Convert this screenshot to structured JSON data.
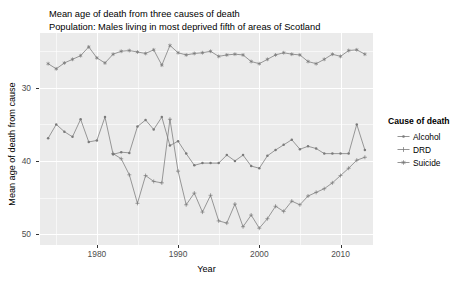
{
  "title": {
    "line1": "Mean age of death from three causes of death",
    "line2": "Population: Males living in most deprived fifth of areas of Scotland"
  },
  "axes": {
    "x_title": "Year",
    "y_title": "Mean age of death from cause",
    "x_ticks": [
      "1980",
      "1990",
      "2000",
      "2010"
    ],
    "y_ticks": [
      "50",
      "40",
      "30"
    ]
  },
  "legend": {
    "title": "Cause of death",
    "items": [
      {
        "label": "Alcohol",
        "color": "#7a7a7a",
        "shape": "dash"
      },
      {
        "label": "DRD",
        "color": "#7a7a7a",
        "shape": "plus"
      },
      {
        "label": "Suicide",
        "color": "#7a7a7a",
        "shape": "star"
      }
    ]
  },
  "chart_data": {
    "type": "line",
    "title": "Mean age of death from three causes of death",
    "subtitle": "Population: Males living in most deprived fifth of areas of Scotland",
    "xlabel": "Year",
    "ylabel": "Mean age of death from cause",
    "xlim": [
      1973,
      2014
    ],
    "ylim": [
      28.5,
      57.5
    ],
    "xticks": [
      1980,
      1990,
      2000,
      2010
    ],
    "yticks": [
      30,
      40,
      50
    ],
    "grid": true,
    "legend_position": "right",
    "legend_title": "Cause of death",
    "x": [
      1974,
      1975,
      1976,
      1977,
      1978,
      1979,
      1980,
      1981,
      1982,
      1983,
      1984,
      1985,
      1986,
      1987,
      1988,
      1989,
      1990,
      1991,
      1992,
      1993,
      1994,
      1995,
      1996,
      1997,
      1998,
      1999,
      2000,
      2001,
      2002,
      2003,
      2004,
      2005,
      2006,
      2007,
      2008,
      2009,
      2010,
      2011,
      2012,
      2013
    ],
    "series": [
      {
        "name": "Suicide",
        "color": "#7a7a7a",
        "values": [
          53.3,
          52.6,
          53.4,
          53.9,
          54.4,
          55.6,
          54.1,
          53.4,
          54.6,
          55.0,
          55.1,
          54.9,
          54.7,
          55.2,
          53.1,
          55.8,
          54.8,
          54.5,
          54.7,
          54.8,
          55.0,
          54.3,
          54.5,
          54.6,
          54.5,
          53.6,
          53.3,
          53.9,
          54.5,
          54.8,
          54.6,
          54.5,
          53.6,
          53.3,
          53.9,
          54.6,
          54.3,
          55.1,
          55.2,
          54.6
        ]
      },
      {
        "name": "Alcohol",
        "color": "#7a7a7a",
        "values": [
          43.1,
          45.0,
          44.0,
          43.3,
          45.7,
          42.6,
          42.8,
          46.0,
          40.9,
          41.2,
          41.1,
          44.7,
          45.6,
          44.3,
          46.0,
          42.1,
          42.7,
          41.0,
          39.4,
          39.7,
          39.7,
          39.7,
          40.8,
          40.0,
          40.8,
          39.3,
          39.0,
          40.7,
          41.5,
          42.2,
          42.9,
          41.6,
          42.0,
          41.7,
          41.0,
          41.0,
          41.0,
          41.0,
          45.0,
          41.5
        ]
      },
      {
        "name": "DRD",
        "color": "#7a7a7a",
        "values": [
          null,
          null,
          null,
          null,
          null,
          null,
          null,
          null,
          41.0,
          40.3,
          38.1,
          34.2,
          38.0,
          37.2,
          37.0,
          45.7,
          38.6,
          34.0,
          35.6,
          33.0,
          35.3,
          31.8,
          31.5,
          34.1,
          31.0,
          32.6,
          30.8,
          32.1,
          33.8,
          33.1,
          34.5,
          34.0,
          35.2,
          35.7,
          36.2,
          37.0,
          38.0,
          39.0,
          40.1,
          40.5
        ]
      }
    ]
  },
  "colors": {
    "panel_background": "#ebebeb",
    "grid": "#ffffff",
    "series": "#7a7a7a",
    "tick_label": "#4d4d4d"
  }
}
